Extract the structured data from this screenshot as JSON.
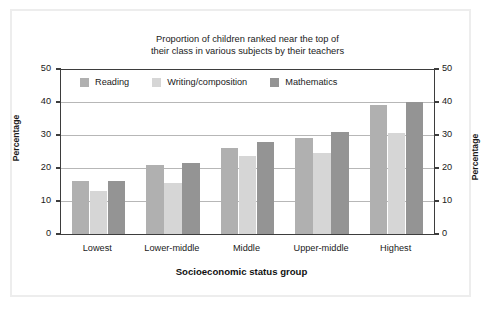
{
  "chart_data": {
    "type": "bar",
    "title": "Proportion of children ranked near the top of their class in various subjects by their teachers",
    "title_line1": "Proportion of children ranked near the top of",
    "title_line2": "their class in various subjects by their teachers",
    "xlabel": "Socioeconomic status group",
    "ylabel": "Percentage",
    "ylabel_right": "Percentage",
    "ylim": [
      0,
      50
    ],
    "yticks": [
      0,
      10,
      20,
      30,
      40,
      50
    ],
    "ytick_labels": [
      "0",
      "10",
      "20",
      "30",
      "40",
      "50"
    ],
    "grid": true,
    "legend_position": "top-inside",
    "categories": [
      "Lowest",
      "Lower-middle",
      "Middle",
      "Upper-middle",
      "Highest"
    ],
    "series": [
      {
        "name": "Reading",
        "color": "#b0b0b0",
        "values": [
          16,
          21,
          26,
          29,
          39
        ]
      },
      {
        "name": "Writing/composition",
        "color": "#d6d6d6",
        "values": [
          13,
          15.5,
          23.5,
          24.5,
          30.5
        ]
      },
      {
        "name": "Mathematics",
        "color": "#949494",
        "values": [
          16,
          21.5,
          28,
          31,
          40
        ]
      }
    ]
  },
  "colors": {
    "axis": "#3d3d3d",
    "grid": "#b7b7b7",
    "text": "#1a1a1a",
    "frame": "#ededed",
    "background": "#ffffff"
  }
}
